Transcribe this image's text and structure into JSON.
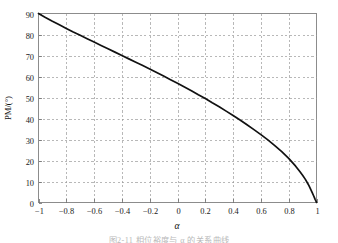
{
  "figure": {
    "y_axis_label": "PM/(°)",
    "x_axis_label": "α",
    "caption": "图2-11  相位裕度与 α 的关系曲线"
  },
  "chart_data": {
    "type": "line",
    "title": "",
    "xlabel": "α",
    "ylabel": "PM/(°)",
    "xlim": [
      -1,
      1
    ],
    "ylim": [
      0,
      90
    ],
    "grid": true,
    "legend": null,
    "xticks": [
      -1,
      -0.8,
      -0.6,
      -0.4,
      -0.2,
      0,
      0.2,
      0.4,
      0.6,
      0.8,
      1
    ],
    "xticklabels": [
      "−1",
      "−0.8",
      "−0.6",
      "−0.4",
      "−0.2",
      "0",
      "0.2",
      "0.4",
      "0.6",
      "0.8",
      "1"
    ],
    "yticks": [
      0,
      10,
      20,
      30,
      40,
      50,
      60,
      70,
      80,
      90
    ],
    "yticklabels": [
      "0",
      "10",
      "20",
      "30",
      "40",
      "50",
      "60",
      "70",
      "80",
      "90"
    ],
    "series": [
      {
        "name": "PM(α)",
        "color": "#111111",
        "x": [
          -1.0,
          -0.95,
          -0.9,
          -0.85,
          -0.8,
          -0.75,
          -0.7,
          -0.65,
          -0.6,
          -0.55,
          -0.5,
          -0.45,
          -0.4,
          -0.35,
          -0.3,
          -0.25,
          -0.2,
          -0.15,
          -0.1,
          -0.05,
          0.0,
          0.05,
          0.1,
          0.15,
          0.2,
          0.25,
          0.3,
          0.35,
          0.4,
          0.45,
          0.5,
          0.55,
          0.6,
          0.65,
          0.7,
          0.75,
          0.8,
          0.85,
          0.88,
          0.9,
          0.92,
          0.94,
          0.95,
          0.96,
          0.97,
          0.98,
          0.985,
          0.99,
          0.994,
          0.997,
          0.999,
          1.0
        ],
        "y": [
          90.0,
          88.1,
          86.3,
          84.6,
          82.9,
          81.2,
          79.6,
          78.0,
          76.4,
          74.8,
          73.2,
          71.6,
          70.0,
          68.4,
          66.8,
          65.2,
          63.6,
          61.9,
          60.2,
          58.5,
          56.8,
          55.0,
          53.2,
          51.3,
          49.5,
          47.5,
          45.6,
          43.5,
          41.4,
          39.3,
          37.0,
          34.7,
          32.3,
          29.8,
          27.1,
          24.2,
          21.0,
          17.3,
          14.8,
          13.0,
          11.0,
          8.7,
          7.4,
          6.0,
          4.6,
          3.1,
          2.3,
          1.5,
          0.95,
          0.55,
          0.2,
          0.0
        ]
      }
    ],
    "annotations": []
  }
}
